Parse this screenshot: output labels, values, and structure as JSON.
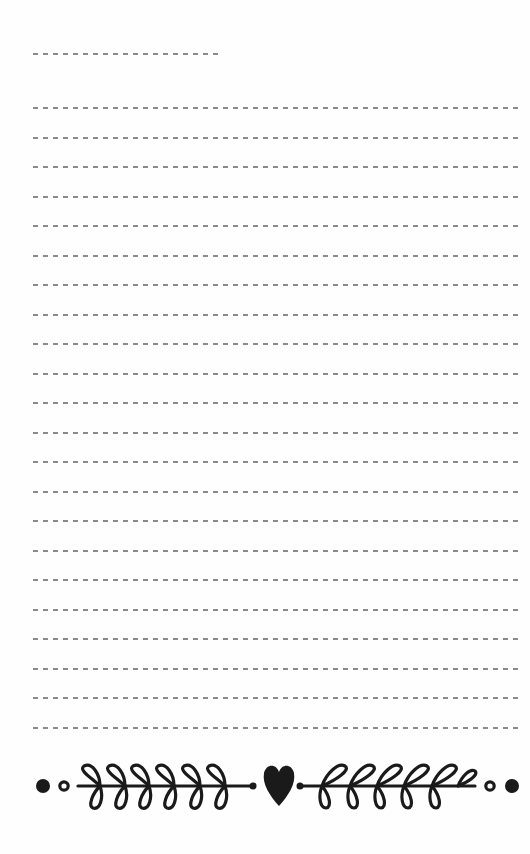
{
  "page": {
    "type": "lined-notepad",
    "background_color": "#ffffff",
    "line_color": "#8a8a8a",
    "ornament_color": "#1a1a1a"
  },
  "header_line": {
    "kind": "short-dashed-line",
    "x_start": 33,
    "x_end": 222,
    "y": 54
  },
  "writing_lines": {
    "count": 22,
    "first_y": 108,
    "spacing": 29.5,
    "x_start": 33,
    "x_end": 523,
    "style": "dashed"
  },
  "ornament": {
    "description": "laurel-branch divider with heart center",
    "left": {
      "dots": [
        "filled-dot",
        "open-circle"
      ],
      "branch": "laurel-branch-left",
      "leaf_pairs": 6
    },
    "center": "heart-icon",
    "right": {
      "branch": "laurel-branch-right",
      "leaf_pairs": 6,
      "dots": [
        "open-circle",
        "filled-dot"
      ]
    }
  }
}
